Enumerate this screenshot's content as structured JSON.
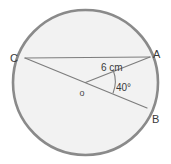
{
  "figure": {
    "type": "circle-geometry-diagram",
    "background_color": "#ffffff",
    "circle": {
      "name": "main-circle",
      "center_x": 85.5,
      "center_y": 82.5,
      "radius": 72.5,
      "fill_color": "#f2f2f2",
      "stroke_color": "#8a8a8a",
      "stroke_width": 2.6
    },
    "center_point": {
      "label": "o",
      "x": 85.5,
      "y": 82.5,
      "label_x": 82,
      "label_y": 96
    },
    "points": [
      {
        "name": "point-c",
        "label": "C",
        "x": 25,
        "y": 58,
        "label_x": 10,
        "label_y": 62
      },
      {
        "name": "point-a",
        "label": "A",
        "x": 150,
        "y": 57,
        "label_x": 153,
        "label_y": 58
      },
      {
        "name": "point-b",
        "label": "B",
        "x": 147,
        "y": 108,
        "label_x": 152,
        "label_y": 123
      }
    ],
    "segments": [
      {
        "name": "chord-ca",
        "from": "C",
        "to": "A",
        "x1": 25,
        "y1": 58,
        "x2": 150,
        "y2": 57,
        "stroke_color": "#7d7d7d",
        "stroke_width": 1.2,
        "kind": "chord"
      },
      {
        "name": "diameter-cb",
        "from": "C",
        "to": "B",
        "x1": 25,
        "y1": 58,
        "x2": 147,
        "y2": 108,
        "stroke_color": "#7d7d7d",
        "stroke_width": 1.2,
        "kind": "diameter"
      },
      {
        "name": "radius-oa",
        "from": "o",
        "to": "A",
        "x1": 85.5,
        "y1": 82.5,
        "x2": 150,
        "y2": 57,
        "stroke_color": "#7d7d7d",
        "stroke_width": 1.2,
        "kind": "radius"
      }
    ],
    "measurements": [
      {
        "name": "radius-length-label",
        "text": "6 cm",
        "x": 101,
        "y": 71,
        "refers_to": "radius-oa"
      },
      {
        "name": "central-angle-label",
        "text": "40°",
        "x": 116,
        "y": 91,
        "refers_to": "angle-aob"
      }
    ],
    "angle_arc": {
      "name": "angle-arc-marker",
      "path": "M 113.2 70.3 A 31 31 0 0 1 113.0 93.0",
      "stroke_color": "#7d7d7d",
      "stroke_width": 1.1
    }
  }
}
